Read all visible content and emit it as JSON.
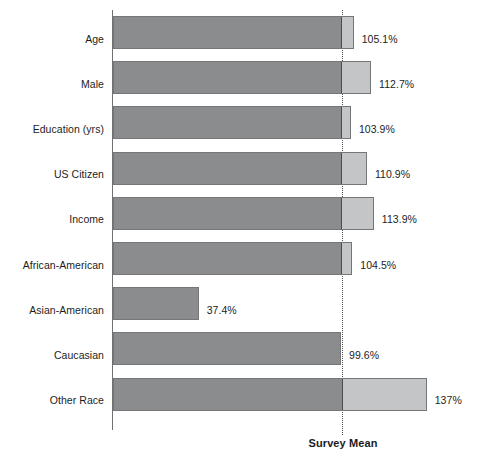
{
  "chart_data": {
    "type": "bar",
    "title": "",
    "subtitle": "",
    "xlabel": "",
    "ylabel": "",
    "orientation": "horizontal",
    "grid": false,
    "legend": null,
    "xlim": [
      0,
      145
    ],
    "reference_line": {
      "label": "Survey Mean",
      "value": 100,
      "style": "dotted",
      "color": "#4a4c4e"
    },
    "value_unit": "%",
    "categories": [
      "Age",
      "Male",
      "Education (yrs)",
      "US Citizen",
      "Income",
      "African-American",
      "Asian-American",
      "Caucasian",
      "Other Race"
    ],
    "values": [
      105.1,
      112.7,
      103.9,
      110.9,
      113.9,
      104.5,
      37.4,
      99.6,
      137
    ],
    "value_labels": [
      "105.1%",
      "112.7%",
      "103.9%",
      "110.9%",
      "113.9%",
      "104.5%",
      "37.4%",
      "99.6%",
      "137%"
    ],
    "colors": {
      "below_mean_segment": "#8a8c8e",
      "above_mean_segment": "#c3c5c7",
      "bar_outline": "#74767a",
      "axis": "#6f7173",
      "text": "#1d1d1d"
    }
  },
  "rows": [
    {
      "label": "Age",
      "value": 105.1,
      "value_label": "105.1%"
    },
    {
      "label": "Male",
      "value": 112.7,
      "value_label": "112.7%"
    },
    {
      "label": "Education (yrs)",
      "value": 103.9,
      "value_label": "103.9%"
    },
    {
      "label": "US Citizen",
      "value": 110.9,
      "value_label": "110.9%"
    },
    {
      "label": "Income",
      "value": 113.9,
      "value_label": "113.9%"
    },
    {
      "label": "African-American",
      "value": 104.5,
      "value_label": "104.5%"
    },
    {
      "label": "Asian-American",
      "value": 37.4,
      "value_label": "37.4%"
    },
    {
      "label": "Caucasian",
      "value": 99.6,
      "value_label": "99.6%"
    },
    {
      "label": "Other Race",
      "value": 137,
      "value_label": "137%"
    }
  ],
  "reference": {
    "label": "Survey Mean"
  }
}
